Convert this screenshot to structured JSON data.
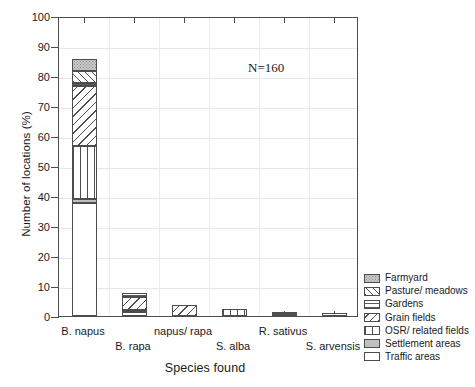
{
  "chart_data": {
    "type": "bar",
    "subtype": "stacked",
    "title": "",
    "xlabel": "Species found",
    "ylabel": "Number of locations (%)",
    "ylim": [
      0,
      100
    ],
    "ytick_step": 10,
    "yticks": [
      0,
      10,
      20,
      30,
      40,
      50,
      60,
      70,
      80,
      90,
      100
    ],
    "ytick_labels": [
      "0",
      "10",
      "20",
      "30",
      "40",
      "50",
      "60",
      "70",
      "80",
      "90",
      "100"
    ],
    "grid": "both",
    "legend_position": "right-bottom-outside",
    "annotation": "N=160",
    "categories": [
      "B. napus",
      "B. rapa",
      "napus/ rapa",
      "S. alba",
      "R. sativus",
      "S. arvensis"
    ],
    "series": [
      {
        "name": "Farmyard",
        "key": "farmyard",
        "values": [
          4.0,
          0.0,
          0.0,
          0.0,
          0.0,
          0.0
        ]
      },
      {
        "name": "Pasture/ meadows",
        "key": "pasture",
        "values": [
          3.8,
          0.0,
          0.0,
          0.0,
          0.0,
          0.0
        ]
      },
      {
        "name": "Gardens",
        "key": "gardens",
        "values": [
          1.0,
          1.3,
          0.0,
          0.0,
          0.0,
          0.0
        ]
      },
      {
        "name": "Grain fields",
        "key": "grain",
        "values": [
          20.0,
          4.4,
          3.8,
          0.0,
          0.0,
          0.0
        ]
      },
      {
        "name": "OSR/ related fields",
        "key": "osr",
        "values": [
          17.7,
          0.0,
          0.0,
          2.5,
          0.0,
          0.0
        ]
      },
      {
        "name": "Settlement areas",
        "key": "settlement",
        "values": [
          1.3,
          0.6,
          0.0,
          0.0,
          0.6,
          0.0
        ]
      },
      {
        "name": "Traffic areas",
        "key": "traffic",
        "values": [
          37.8,
          1.3,
          0.0,
          0.0,
          0.6,
          1.0
        ]
      }
    ],
    "totals": [
      85.6,
      7.6,
      3.8,
      2.5,
      1.2,
      1.0
    ]
  },
  "legend": {
    "items": [
      {
        "label": "Farmyard",
        "pattern": "solid-dotted-gray"
      },
      {
        "label": "Pasture/ meadows",
        "pattern": "diagonal-up-hatch"
      },
      {
        "label": "Gardens",
        "pattern": "horizontal-lines"
      },
      {
        "label": "Grain fields",
        "pattern": "diagonal-down-hatch"
      },
      {
        "label": "OSR/ related fields",
        "pattern": "vertical-lines"
      },
      {
        "label": "Settlement areas",
        "pattern": "solid-gray"
      },
      {
        "label": "Traffic areas",
        "pattern": "white"
      }
    ]
  },
  "colors": {
    "axis": "#4d4d4d",
    "grid": "#e8e8e8",
    "farmyard": "#c9c9c9",
    "settlement": "#bfbfbf",
    "traffic": "#ffffff",
    "hatch": "#4d4d4d"
  }
}
